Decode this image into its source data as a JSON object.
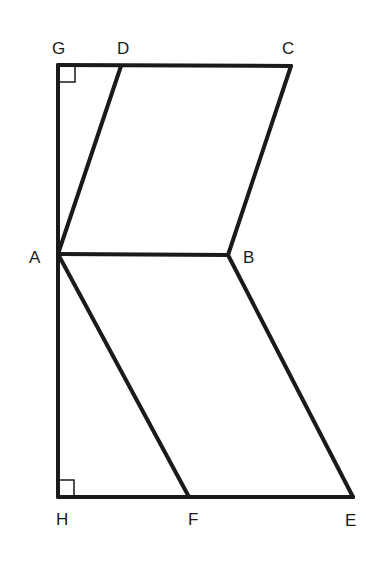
{
  "diagram": {
    "type": "geometry",
    "points": {
      "G": {
        "label": "G",
        "x": 58,
        "y": 65
      },
      "D": {
        "label": "D",
        "x": 121,
        "y": 66
      },
      "C": {
        "label": "C",
        "x": 291,
        "y": 66
      },
      "A": {
        "label": "A",
        "x": 58,
        "y": 254
      },
      "B": {
        "label": "B",
        "x": 228,
        "y": 255
      },
      "H": {
        "label": "H",
        "x": 58,
        "y": 497
      },
      "F": {
        "label": "F",
        "x": 189,
        "y": 497
      },
      "E": {
        "label": "E",
        "x": 353,
        "y": 497
      }
    },
    "segments": [
      "GC",
      "GH",
      "AD",
      "BC",
      "AB",
      "AF",
      "BE",
      "HE"
    ],
    "right_angles": [
      "G",
      "H"
    ],
    "stroke_color": "#1a1a1a"
  }
}
